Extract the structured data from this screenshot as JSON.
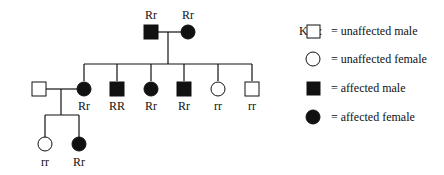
{
  "pedigree": {
    "generation1": [
      {
        "sex": "male",
        "affected": true,
        "genotype": "Rr"
      },
      {
        "sex": "female",
        "affected": true,
        "genotype": "Rr"
      }
    ],
    "generation2": [
      {
        "sex": "male",
        "affected": false,
        "genotype": ""
      },
      {
        "sex": "female",
        "affected": true,
        "genotype": "Rr"
      },
      {
        "sex": "male",
        "affected": true,
        "genotype": "RR"
      },
      {
        "sex": "female",
        "affected": true,
        "genotype": "Rr"
      },
      {
        "sex": "male",
        "affected": true,
        "genotype": "Rr"
      },
      {
        "sex": "female",
        "affected": false,
        "genotype": "rr"
      },
      {
        "sex": "male",
        "affected": false,
        "genotype": "rr"
      }
    ],
    "generation3": [
      {
        "sex": "female",
        "affected": false,
        "genotype": "rr"
      },
      {
        "sex": "female",
        "affected": true,
        "genotype": "Rr"
      }
    ]
  },
  "key": {
    "title": "Key:",
    "items": [
      {
        "symbol": "square-open",
        "label": "= unaffected male"
      },
      {
        "symbol": "circle-open",
        "label": "= unaffected female"
      },
      {
        "symbol": "square-filled",
        "label": "= affected male"
      },
      {
        "symbol": "circle-filled",
        "label": "= affected female"
      }
    ]
  }
}
